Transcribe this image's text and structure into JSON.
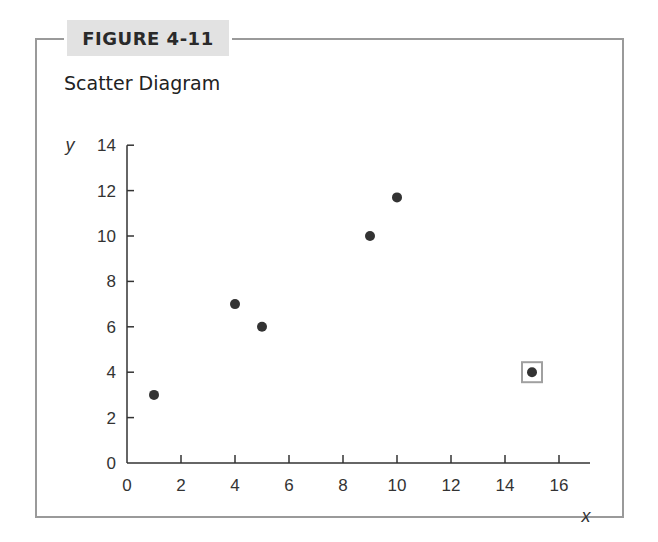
{
  "figure": {
    "label": "FIGURE 4-11",
    "title": "Scatter Diagram"
  },
  "chart_data": {
    "type": "scatter",
    "title": "Scatter Diagram",
    "figure_label": "FIGURE 4-11",
    "xlabel": "x",
    "ylabel": "y",
    "xlim": [
      0,
      17
    ],
    "ylim": [
      0,
      14
    ],
    "xticks": [
      0,
      2,
      4,
      6,
      8,
      10,
      12,
      14,
      16
    ],
    "yticks": [
      0,
      2,
      4,
      6,
      8,
      10,
      12,
      14
    ],
    "grid": false,
    "legend": null,
    "points": [
      {
        "x": 1,
        "y": 3
      },
      {
        "x": 4,
        "y": 7
      },
      {
        "x": 5,
        "y": 6
      },
      {
        "x": 9,
        "y": 10
      },
      {
        "x": 10,
        "y": 11.7
      },
      {
        "x": 15,
        "y": 4,
        "highlighted": true
      }
    ],
    "annotations": [
      "Point (15, 4) enclosed in a square box (outlier)"
    ]
  },
  "colors": {
    "frame": "#9a9a9a",
    "label_bg": "#e2e2e2",
    "axis": "#333333",
    "point": "#333333",
    "highlight_box": "#a0a0a0"
  }
}
